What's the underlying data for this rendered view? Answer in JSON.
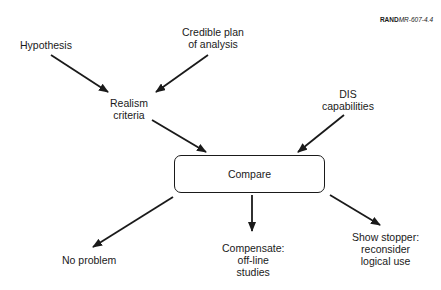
{
  "figure_id": {
    "bold": "RAND",
    "italic": "MR-607-4.4"
  },
  "nodes": {
    "hypothesis": "Hypothesis",
    "credible_plan": [
      "Credible plan",
      "of analysis"
    ],
    "realism_criteria": [
      "Realism",
      "criteria"
    ],
    "dis_capabilities": [
      "DIS",
      "capabilities"
    ],
    "compare": "Compare",
    "no_problem": "No problem",
    "compensate": [
      "Compensate:",
      "off-line",
      "studies"
    ],
    "show_stopper": [
      "Show stopper:",
      "reconsider",
      "logical use"
    ]
  },
  "colors": {
    "stroke": "#1a1a1a",
    "background": "#ffffff"
  }
}
